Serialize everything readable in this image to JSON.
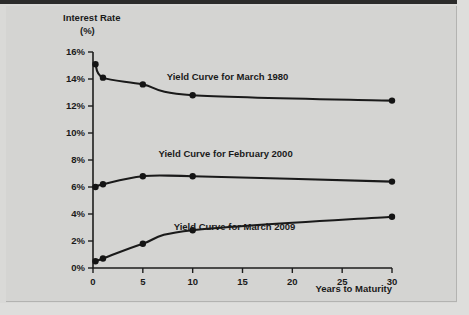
{
  "chart_data": {
    "type": "line",
    "title": "",
    "xlabel": "Years to Maturity",
    "ylabel": "Interest Rate",
    "ylabel_units": "(%)",
    "xlim": [
      0,
      30
    ],
    "ylim": [
      0,
      16
    ],
    "grid": false,
    "legend_position": "inline-annotations",
    "x_ticks": [
      "0",
      "5",
      "10",
      "15",
      "20",
      "25",
      "30"
    ],
    "x_tick_values": [
      0,
      5,
      10,
      15,
      20,
      25,
      30
    ],
    "y_ticks": [
      "0%",
      "2%",
      "4%",
      "6%",
      "8%",
      "10%",
      "12%",
      "14%",
      "16%"
    ],
    "y_tick_values": [
      0,
      2,
      4,
      6,
      8,
      10,
      12,
      14,
      16
    ],
    "series": [
      {
        "name": "Yield Curve for March 1980",
        "label": "Yield Curve for March 1980",
        "x": [
          0.25,
          1,
          5,
          10,
          30
        ],
        "values": [
          15.1,
          14.1,
          13.6,
          12.8,
          12.4
        ]
      },
      {
        "name": "Yield Curve for February 2000",
        "label": "Yield Curve for February 2000",
        "x": [
          0.25,
          1,
          5,
          10,
          30
        ],
        "values": [
          6.0,
          6.2,
          6.8,
          6.8,
          6.4
        ]
      },
      {
        "name": "Yield Curve for March 2009",
        "label": "Yield Curve for March 2009",
        "x": [
          0.25,
          1,
          5,
          10,
          30
        ],
        "values": [
          0.5,
          0.7,
          1.8,
          2.8,
          3.8
        ]
      }
    ],
    "annotations": [
      {
        "text": "Yield Curve for March 1980",
        "x": 13.5,
        "y": 13.9
      },
      {
        "text": "Yield Curve for February 2000",
        "x": 13.3,
        "y": 8.2
      },
      {
        "text": "Yield Curve for March 2009",
        "x": 14.2,
        "y": 2.8
      }
    ],
    "colors": {
      "ink": "#1a1a1a",
      "background": "#d4d4d2",
      "frame": "#2b2b2b"
    }
  }
}
